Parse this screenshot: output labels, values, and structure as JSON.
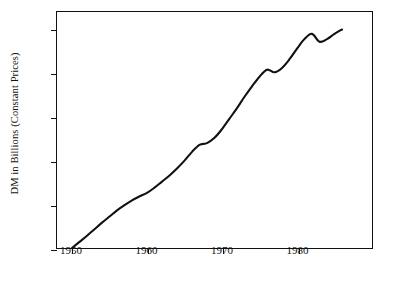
{
  "chart_data": {
    "type": "line",
    "title": "",
    "xlabel": "",
    "ylabel": "DM in Billions (Constant Prices)",
    "xlim": [
      1948,
      1990
    ],
    "ylim": [
      100,
      640
    ],
    "grid": false,
    "legend": null,
    "xticks": [
      1950,
      1960,
      1970,
      1980
    ],
    "xtick_labels": [
      "1950",
      "1960",
      "1970",
      "1980"
    ],
    "yticks": [
      100,
      200,
      300,
      400,
      500,
      600
    ],
    "ytick_labels": [
      "100",
      "200",
      "300",
      "400",
      "500",
      "600"
    ],
    "series": [
      {
        "name": "DM in Billions (Constant Prices)",
        "color": "#111111",
        "x": [
          1950,
          1951,
          1952,
          1953,
          1954,
          1955,
          1956,
          1957,
          1958,
          1959,
          1960,
          1961,
          1962,
          1963,
          1964,
          1965,
          1966,
          1967,
          1968,
          1969,
          1970,
          1971,
          1972,
          1973,
          1974,
          1975,
          1976,
          1977,
          1978,
          1979,
          1980,
          1981,
          1982,
          1983,
          1984,
          1985,
          1986
        ],
        "y": [
          100,
          114,
          128,
          143,
          158,
          172,
          186,
          198,
          209,
          218,
          226,
          238,
          252,
          266,
          282,
          300,
          320,
          336,
          340,
          352,
          372,
          396,
          420,
          446,
          470,
          492,
          508,
          502,
          512,
          532,
          556,
          578,
          590,
          572,
          578,
          590,
          600
        ]
      }
    ]
  }
}
